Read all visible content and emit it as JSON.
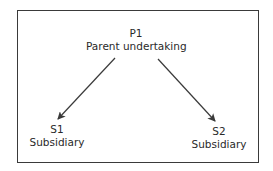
{
  "diagram": {
    "type": "tree",
    "nodes": [
      {
        "id": "P1",
        "code": "P1",
        "label": "Parent undertaking"
      },
      {
        "id": "S1",
        "code": "S1",
        "label": "Subsidiary"
      },
      {
        "id": "S2",
        "code": "S2",
        "label": "Subsidiary"
      }
    ],
    "edges": [
      {
        "from": "P1",
        "to": "S1"
      },
      {
        "from": "P1",
        "to": "S2"
      }
    ],
    "colors": {
      "line": "#3a3a3a",
      "text": "#2a2a2a",
      "background": "#ffffff"
    }
  }
}
